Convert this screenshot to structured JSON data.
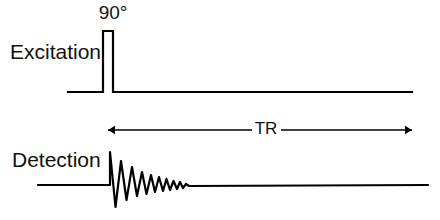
{
  "figure": {
    "type": "pulse-sequence-timing-diagram",
    "background_color": "#ffffff",
    "line_color": "#000000",
    "width": 440,
    "height": 220
  },
  "rows": {
    "excitation": {
      "label": "Excitation",
      "label_x": 10,
      "label_y": 53,
      "baseline_y": 92,
      "baseline_start_x": 68,
      "baseline_end_x": 412,
      "pulse": {
        "label": "90°",
        "label_x": 113,
        "label_y": 14,
        "left_x": 103,
        "right_x": 113,
        "top_y": 31
      }
    },
    "detection": {
      "label": "Detection",
      "label_x": 12,
      "label_y": 161,
      "baseline_y": 185,
      "baseline_start_x": 38,
      "baseline_end_x": 428,
      "fid": {
        "name": "free-induction-decay",
        "start_x": 110,
        "decay_end_x": 185,
        "peak_y": 152,
        "trough_y": 207
      }
    }
  },
  "interval": {
    "label": "TR",
    "label_x": 266,
    "label_y": 130,
    "line_y": 130,
    "start_x": 108,
    "end_x": 412,
    "left_gap_x": 252,
    "right_gap_x": 281,
    "arrowhead_size": 7
  },
  "chart_data": {
    "type": "line",
    "title": "",
    "xlabel": "",
    "ylabel": "",
    "grid": false,
    "legend": null,
    "annotations": [
      {
        "text": "90°",
        "x": 113,
        "y": 14,
        "describes": "90-degree excitation pulse flip angle"
      },
      {
        "text": "TR",
        "x": 266,
        "y": 130,
        "describes": "repetition time between successive excitation pulses"
      }
    ],
    "series": [
      {
        "name": "Excitation",
        "description": "Flat baseline with a single narrow rectangular 90-degree RF pulse",
        "points": [
          [
            68,
            92
          ],
          [
            103,
            92
          ],
          [
            103,
            31
          ],
          [
            113,
            31
          ],
          [
            113,
            92
          ],
          [
            412,
            92
          ]
        ]
      },
      {
        "name": "Detection",
        "description": "Flat baseline followed by an exponentially damped oscillating free induction decay signal",
        "points": [
          [
            38,
            185
          ],
          [
            110,
            185
          ],
          [
            110,
            152
          ],
          [
            115.5,
            207
          ],
          [
            121,
            161
          ],
          [
            126.5,
            200
          ],
          [
            132,
            167
          ],
          [
            137,
            196
          ],
          [
            142,
            172
          ],
          [
            146.5,
            194
          ],
          [
            151,
            175
          ],
          [
            155,
            192
          ],
          [
            159,
            177
          ],
          [
            163,
            191
          ],
          [
            166.5,
            179
          ],
          [
            170,
            190
          ],
          [
            173.5,
            181
          ],
          [
            177,
            189
          ],
          [
            180,
            182
          ],
          [
            183,
            188
          ],
          [
            186,
            184
          ],
          [
            189,
            186
          ],
          [
            428,
            185
          ]
        ]
      }
    ]
  }
}
